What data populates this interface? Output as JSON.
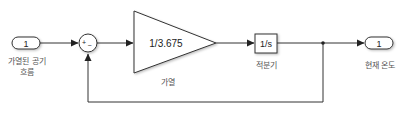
{
  "diagram": {
    "type": "simulink-block-diagram",
    "blocks": {
      "inport": {
        "number": "1",
        "label_line1": "가열된 공기",
        "label_line2": "흐름"
      },
      "sum": {
        "signs": "+_",
        "plus": "+",
        "minus": "−"
      },
      "gain": {
        "value": "1/3.675",
        "label": "가열"
      },
      "integrator": {
        "value": "1/s",
        "label": "적분기"
      },
      "outport": {
        "number": "1",
        "label": "현재 온도"
      }
    },
    "connections": [
      {
        "from": "inport",
        "to": "sum",
        "port": "+"
      },
      {
        "from": "sum",
        "to": "gain"
      },
      {
        "from": "gain",
        "to": "integrator"
      },
      {
        "from": "integrator",
        "to": "outport"
      },
      {
        "from": "integrator-output-branch",
        "to": "sum",
        "port": "-"
      }
    ],
    "colors": {
      "line": "#333333",
      "block_border": "#333333",
      "label": "#555555",
      "background": "#ffffff"
    }
  }
}
